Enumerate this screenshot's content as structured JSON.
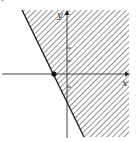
{
  "figure": {
    "type": "inequality-graph",
    "corner_mark": "•",
    "axes": {
      "x_label": "x",
      "y_label": "y"
    },
    "boundary_line": {
      "style": "solid",
      "x_intercept_point": "filled-dot"
    },
    "shaded_region": "right of boundary line",
    "colors": {
      "line": "#222222",
      "hatch": "#555555",
      "axis": "#444444",
      "background": "#ffffff"
    }
  }
}
